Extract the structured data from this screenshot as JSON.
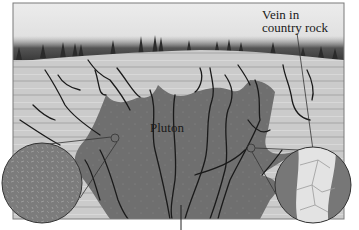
{
  "diagram": {
    "type": "geologic cross-section",
    "labels": {
      "vein_line1": "Vein in",
      "vein_line2": "country rock",
      "pluton": "Pluton"
    },
    "regions": {
      "sky": "sky-gradient",
      "treeline": "forest-horizon",
      "country_rock": "layered-country-rock",
      "pluton": "pluton-body",
      "veins": "branching-veins"
    },
    "insets": [
      {
        "name": "fine-grained-texture-magnifier",
        "position": "bottom-left"
      },
      {
        "name": "vein-crossing-crystals-magnifier",
        "position": "bottom-right"
      }
    ],
    "colors": {
      "sky_top": "#e8e8e8",
      "sky_bottom": "#d0d0d0",
      "trees": "#2a2a2a",
      "country_rock": "#c9c9c9",
      "country_rock_stripe": "#b5b5b5",
      "pluton": "#6e6e6e",
      "vein": "#1a1a1a",
      "frame": "#7a7a7a"
    }
  }
}
